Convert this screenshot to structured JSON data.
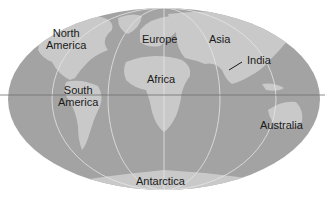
{
  "map": {
    "projection": "elliptical world map",
    "colors": {
      "ocean": "#a3a3a3",
      "land": "#c9c9c9",
      "graticule": "#e6e6e6",
      "equator": "#6e6e6e",
      "background": "#ffffff"
    },
    "labels": {
      "north_america": {
        "line1": "North",
        "line2": "America"
      },
      "south_america": {
        "line1": "South",
        "line2": "America"
      },
      "europe": "Europe",
      "asia": "Asia",
      "india": "India",
      "africa": "Africa",
      "australia": "Australia",
      "antarctica": "Antarctica"
    }
  }
}
